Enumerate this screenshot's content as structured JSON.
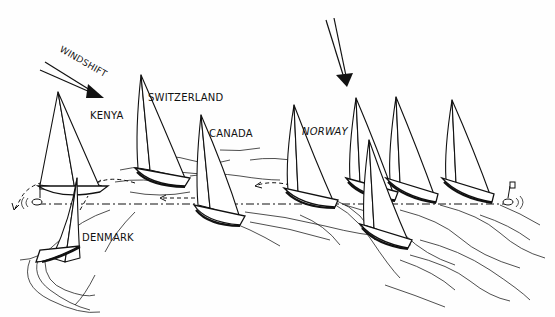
{
  "diagram": {
    "type": "sailing-race-illustration",
    "labels": {
      "windshift": "WINDSHIFT",
      "kenya": "KENYA",
      "switzerland": "SWITZERLAND",
      "canada": "CANADA",
      "norway": "NORWAY",
      "denmark": "DENMARK"
    },
    "arrows": [
      {
        "name": "windshift-arrow",
        "direction": "down-right"
      },
      {
        "name": "wind-arrow",
        "direction": "down"
      }
    ],
    "boats": [
      {
        "team": "Kenya",
        "x": 70,
        "y": 200
      },
      {
        "team": "Denmark",
        "x": 65,
        "y": 250
      },
      {
        "team": "Switzerland",
        "x": 170,
        "y": 175
      },
      {
        "team": "Canada",
        "x": 230,
        "y": 210
      },
      {
        "team": "Norway",
        "x": 310,
        "y": 195
      },
      {
        "team": "unlabeled-1",
        "x": 370,
        "y": 190
      },
      {
        "team": "unlabeled-2",
        "x": 380,
        "y": 240
      },
      {
        "team": "unlabeled-3",
        "x": 415,
        "y": 190
      },
      {
        "team": "unlabeled-4",
        "x": 470,
        "y": 195
      }
    ],
    "marks": [
      {
        "name": "left-mark",
        "x": 35,
        "y": 203
      },
      {
        "name": "right-mark",
        "x": 513,
        "y": 203
      }
    ],
    "colors": {
      "ink": "#111111",
      "paper": "#fefefe"
    }
  }
}
